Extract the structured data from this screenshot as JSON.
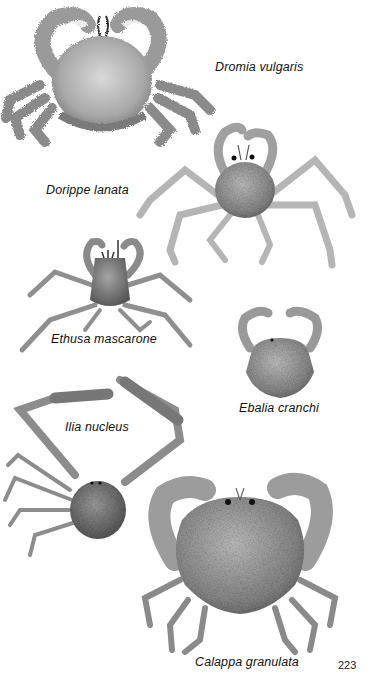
{
  "page": {
    "page_number": "223",
    "background_color": "#ffffff",
    "ink_color": "#111111"
  },
  "species": [
    {
      "id": "dromia",
      "caption": "Dromia vulgaris"
    },
    {
      "id": "dorippe",
      "caption": "Dorippe lanata"
    },
    {
      "id": "ethusa",
      "caption": "Ethusa mascarone"
    },
    {
      "id": "ebalia",
      "caption": "Ebalia cranchi"
    },
    {
      "id": "ilia",
      "caption": "Ilia nucleus"
    },
    {
      "id": "calappa",
      "caption": "Calappa granulata"
    }
  ]
}
